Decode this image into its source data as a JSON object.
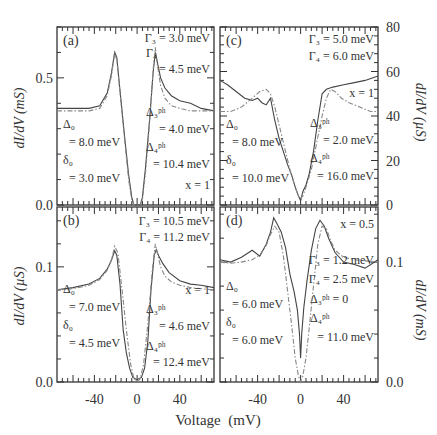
{
  "figure": {
    "xlabel": "Voltage  (mV)",
    "left_ylabel_top": "dI/dV  (mS)",
    "left_ylabel_bottom": "dI/dV  (µS)",
    "right_ylabel_top": "dI/dV  (µS)",
    "right_ylabel_bottom": "dI/dV  (mS)"
  },
  "chart_data": [
    {
      "panel": "(a)",
      "type": "line",
      "xlabel": "Voltage (mV)",
      "ylabel": "dI/dV (mS)",
      "xlim": [
        -75,
        72
      ],
      "ylim": [
        0,
        0.7
      ],
      "xticks": [
        -40,
        0,
        40
      ],
      "yticks": [
        0.0,
        0.5
      ],
      "ytick_labels": [
        "0.0",
        "0.5"
      ],
      "annotations_left": [
        "Δ₀",
        "= 8.0 meV",
        "δ₀",
        "= 3.0 meV"
      ],
      "annotations_right": [
        "Γ₃ = 3.0 meV",
        "Γ₄",
        "= 4.5 meV",
        "Δ₃ᵖʰ",
        "= 4.0 meV",
        "Δ₄ᵖʰ",
        "= 10.4 meV",
        "x = 1"
      ],
      "series": [
        {
          "name": "experiment",
          "style": "solid",
          "x": [
            -75,
            -60,
            -45,
            -35,
            -28,
            -24,
            -21,
            -19,
            -16,
            -12,
            -8,
            -5,
            -3,
            0,
            3,
            5,
            8,
            12,
            15,
            17,
            19,
            22,
            26,
            32,
            40,
            50,
            60,
            72
          ],
          "y": [
            0.38,
            0.38,
            0.38,
            0.39,
            0.44,
            0.52,
            0.6,
            0.58,
            0.45,
            0.28,
            0.12,
            0.03,
            0.0,
            0.0,
            0.0,
            0.03,
            0.15,
            0.35,
            0.52,
            0.6,
            0.56,
            0.5,
            0.46,
            0.43,
            0.41,
            0.4,
            0.38,
            0.37
          ]
        },
        {
          "name": "fit",
          "style": "dashdot",
          "x": [
            -75,
            -60,
            -45,
            -35,
            -28,
            -24,
            -21,
            -19,
            -16,
            -12,
            -8,
            -5,
            -3,
            0,
            3,
            5,
            8,
            12,
            15,
            17,
            19,
            22,
            26,
            32,
            40,
            50,
            60,
            72
          ],
          "y": [
            0.37,
            0.37,
            0.37,
            0.38,
            0.43,
            0.51,
            0.6,
            0.57,
            0.44,
            0.27,
            0.1,
            0.02,
            0.0,
            0.0,
            0.0,
            0.02,
            0.13,
            0.34,
            0.53,
            0.62,
            0.55,
            0.47,
            0.42,
            0.39,
            0.38,
            0.37,
            0.37,
            0.37
          ]
        }
      ]
    },
    {
      "panel": "(b)",
      "type": "line",
      "xlabel": "Voltage (mV)",
      "ylabel": "dI/dV (µS)",
      "xlim": [
        -75,
        72
      ],
      "ylim": [
        0,
        0.152
      ],
      "xticks": [
        -40,
        0,
        40
      ],
      "yticks": [
        0.0,
        0.1
      ],
      "ytick_labels": [
        "0.0",
        "0.1"
      ],
      "annotations_left": [
        "Δ₀",
        "= 7.0 meV",
        "δ₀",
        "= 4.5 meV"
      ],
      "annotations_right": [
        "Γ₃ = 10.5 meV",
        "Γ₄ = 11.2 meV",
        "x = 1",
        "Δ₃ᵖʰ",
        "= 4.6 meV",
        "Δ₄ᵖʰ",
        "= 12.4 meV"
      ],
      "series": [
        {
          "name": "experiment",
          "style": "solid",
          "x": [
            -75,
            -60,
            -45,
            -35,
            -28,
            -24,
            -21,
            -19,
            -16,
            -13,
            -10,
            -7,
            -4,
            0,
            4,
            7,
            10,
            13,
            16,
            18,
            20,
            24,
            30,
            40,
            50,
            60,
            72
          ],
          "y": [
            0.08,
            0.082,
            0.085,
            0.09,
            0.098,
            0.106,
            0.114,
            0.11,
            0.085,
            0.045,
            0.025,
            0.012,
            0.004,
            0.002,
            0.004,
            0.012,
            0.035,
            0.08,
            0.11,
            0.115,
            0.11,
            0.103,
            0.095,
            0.088,
            0.085,
            0.084,
            0.082
          ]
        },
        {
          "name": "fit",
          "style": "dashdot",
          "x": [
            -75,
            -60,
            -45,
            -35,
            -28,
            -24,
            -21,
            -18,
            -14,
            -10,
            -6,
            -3,
            0,
            3,
            6,
            10,
            14,
            17,
            19,
            22,
            26,
            32,
            40,
            50,
            60,
            72
          ],
          "y": [
            0.08,
            0.081,
            0.084,
            0.089,
            0.097,
            0.106,
            0.118,
            0.112,
            0.08,
            0.045,
            0.015,
            0.003,
            0.0,
            0.003,
            0.015,
            0.05,
            0.095,
            0.12,
            0.112,
            0.1,
            0.092,
            0.087,
            0.084,
            0.082,
            0.081,
            0.08
          ]
        }
      ]
    },
    {
      "panel": "(c)",
      "type": "line",
      "xlabel": "Voltage (mV)",
      "ylabel": "dI/dV (µS)",
      "xlim": [
        -75,
        72
      ],
      "ylim": [
        0,
        80
      ],
      "xticks": [
        -40,
        0,
        40
      ],
      "yticks": [
        0,
        20,
        40,
        60,
        80
      ],
      "ytick_labels": [
        "0",
        "20",
        "40",
        "60",
        "80"
      ],
      "annotations_left": [
        "Δ₀",
        "= 8.0 meV",
        "δ₀",
        "= 10.0 meV"
      ],
      "annotations_right": [
        "Γ₃ = 5.0 meV",
        "Γ₄ = 6.0 meV",
        "x = 1",
        "Δ₃ᵖʰ",
        "= 2.0 meV",
        "Δ₄ᵖʰ",
        "= 16.0 meV"
      ],
      "series": [
        {
          "name": "experiment",
          "style": "solid",
          "x": [
            -75,
            -68,
            -60,
            -52,
            -45,
            -40,
            -36,
            -32,
            -28,
            -24,
            -20,
            -16,
            -12,
            -8,
            -5,
            -2,
            0,
            2,
            5,
            8,
            12,
            16,
            20,
            24,
            30,
            40,
            50,
            60,
            72
          ],
          "y": [
            56,
            54,
            51,
            48,
            47,
            48,
            46,
            45,
            48,
            38,
            30,
            24,
            18,
            13,
            8,
            4,
            2,
            6,
            9,
            14,
            24,
            38,
            50,
            52,
            53,
            54,
            55,
            56,
            58
          ]
        },
        {
          "name": "fit",
          "style": "dashdot",
          "x": [
            -75,
            -65,
            -55,
            -45,
            -38,
            -32,
            -28,
            -24,
            -20,
            -15,
            -10,
            -5,
            -2,
            0,
            2,
            5,
            10,
            15,
            20,
            24,
            28,
            32,
            38,
            45,
            55,
            65,
            72
          ],
          "y": [
            42,
            42,
            44,
            48,
            51,
            52,
            50,
            44,
            36,
            26,
            16,
            8,
            4,
            3,
            4,
            8,
            16,
            28,
            40,
            48,
            52,
            51,
            48,
            46,
            44,
            42,
            42
          ]
        }
      ]
    },
    {
      "panel": "(d)",
      "type": "line",
      "xlabel": "Voltage (mV)",
      "ylabel": "dI/dV (mS)",
      "xlim": [
        -75,
        72
      ],
      "ylim": [
        0,
        0.146
      ],
      "xticks": [
        -40,
        0,
        40
      ],
      "yticks": [
        0.0,
        0.1
      ],
      "ytick_labels": [
        "0.0",
        "0.1"
      ],
      "annotations_left": [
        "Δ₀",
        "= 6.0 meV",
        "δ₀",
        "= 6.0 meV"
      ],
      "annotations_right": [
        "x = 0.5",
        "Γ₃ = 1.2 meV",
        "Γ₄ = 2.5 meV",
        "Δ₃ᵖʰ = 0",
        "Δ₄ᵖʰ",
        "= 11.0 meV"
      ],
      "series": [
        {
          "name": "experiment",
          "style": "solid",
          "x": [
            -75,
            -65,
            -55,
            -45,
            -38,
            -32,
            -28,
            -25,
            -22,
            -18,
            -14,
            -10,
            -6,
            -3,
            -1,
            0,
            1,
            3,
            6,
            10,
            14,
            18,
            22,
            26,
            32,
            40,
            50,
            60,
            72
          ],
          "y": [
            0.102,
            0.1,
            0.104,
            0.11,
            0.105,
            0.115,
            0.125,
            0.137,
            0.132,
            0.125,
            0.112,
            0.09,
            0.075,
            0.06,
            0.04,
            0.02,
            0.04,
            0.062,
            0.085,
            0.11,
            0.128,
            0.135,
            0.13,
            0.12,
            0.108,
            0.1,
            0.098,
            0.095,
            0.102
          ]
        },
        {
          "name": "fit",
          "style": "dashdot",
          "x": [
            -75,
            -65,
            -55,
            -45,
            -38,
            -32,
            -28,
            -24,
            -20,
            -16,
            -12,
            -8,
            -5,
            -2,
            0,
            2,
            5,
            8,
            12,
            16,
            20,
            24,
            28,
            32,
            40,
            50,
            60,
            72
          ],
          "y": [
            0.1,
            0.099,
            0.1,
            0.102,
            0.106,
            0.114,
            0.123,
            0.13,
            0.125,
            0.105,
            0.075,
            0.045,
            0.02,
            0.005,
            0.0,
            0.005,
            0.02,
            0.045,
            0.08,
            0.115,
            0.13,
            0.128,
            0.118,
            0.11,
            0.104,
            0.102,
            0.101,
            0.1
          ]
        }
      ]
    }
  ]
}
